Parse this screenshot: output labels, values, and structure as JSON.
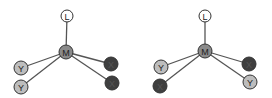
{
  "figure": {
    "colors": {
      "bond": "#555555",
      "outline": "#333333",
      "L_fill": "#ffffff",
      "M_fill": "#8a8a8a",
      "Y_fill": "#bdbdbd",
      "X_fill": "#3f3f3f",
      "light_text": "#222222",
      "dark_text": "#555555"
    },
    "isomers": [
      {
        "name": "isomer-1",
        "nodes": [
          {
            "id": "L",
            "label": "L",
            "type": "L",
            "x": 67,
            "y": 16,
            "r": 6
          },
          {
            "id": "M",
            "label": "M",
            "type": "M",
            "x": 66,
            "y": 52,
            "r": 7
          },
          {
            "id": "Y1",
            "label": "Y",
            "type": "Y",
            "x": 21,
            "y": 68,
            "r": 7
          },
          {
            "id": "Y2",
            "label": "Y",
            "type": "Y",
            "x": 21,
            "y": 87,
            "r": 7
          },
          {
            "id": "X1",
            "label": "X",
            "type": "X",
            "x": 111,
            "y": 64,
            "r": 7
          },
          {
            "id": "X2",
            "label": "X",
            "type": "X",
            "x": 112,
            "y": 83,
            "r": 7
          }
        ],
        "bonds": [
          [
            "M",
            "L"
          ],
          [
            "M",
            "Y1"
          ],
          [
            "M",
            "Y2"
          ],
          [
            "M",
            "X1"
          ],
          [
            "M",
            "X2"
          ]
        ]
      },
      {
        "name": "isomer-2",
        "nodes": [
          {
            "id": "L",
            "label": "L",
            "type": "L",
            "x": 205,
            "y": 16,
            "r": 6
          },
          {
            "id": "M",
            "label": "M",
            "type": "M",
            "x": 205,
            "y": 51,
            "r": 7
          },
          {
            "id": "Y1",
            "label": "Y",
            "type": "Y",
            "x": 161,
            "y": 67,
            "r": 7
          },
          {
            "id": "X1",
            "label": "X",
            "type": "X",
            "x": 160,
            "y": 86,
            "r": 7
          },
          {
            "id": "X2",
            "label": "X",
            "type": "X",
            "x": 249,
            "y": 64,
            "r": 7
          },
          {
            "id": "Y2",
            "label": "Y",
            "type": "Y",
            "x": 250,
            "y": 82,
            "r": 7
          }
        ],
        "bonds": [
          [
            "M",
            "L"
          ],
          [
            "M",
            "Y1"
          ],
          [
            "M",
            "X1"
          ],
          [
            "M",
            "X2"
          ],
          [
            "M",
            "Y2"
          ]
        ]
      }
    ]
  }
}
